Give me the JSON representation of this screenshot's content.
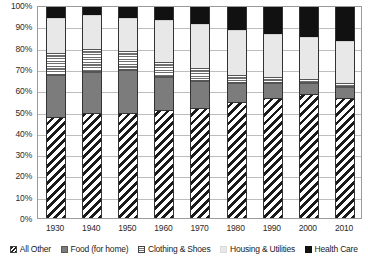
{
  "chart_data": {
    "type": "bar",
    "title": "",
    "subtitle": "",
    "xlabel": "",
    "ylabel": "",
    "stacked": true,
    "stack_mode": "percent",
    "grid": true,
    "legend_position": "bottom",
    "ylim": [
      0,
      100
    ],
    "ytick_labels": [
      "0%",
      "10%",
      "20%",
      "30%",
      "40%",
      "50%",
      "60%",
      "70%",
      "80%",
      "90%",
      "100%"
    ],
    "ytick_values": [
      0,
      10,
      20,
      30,
      40,
      50,
      60,
      70,
      80,
      90,
      100
    ],
    "categories": [
      "1930",
      "1940",
      "1950",
      "1960",
      "1970",
      "1980",
      "1990",
      "2000",
      "2010"
    ],
    "series": [
      {
        "name": "All Other",
        "pattern": "diagonal-hatch",
        "values": [
          48,
          50,
          50,
          51,
          52,
          55,
          57,
          59,
          57
        ]
      },
      {
        "name": "Food (for home)",
        "pattern": "solid-dark-gray",
        "values": [
          20,
          19,
          20,
          16,
          13,
          9,
          7,
          5,
          5
        ]
      },
      {
        "name": "Clothing & Shoes",
        "pattern": "horizontal-stripes",
        "values": [
          10,
          11,
          9,
          7,
          6,
          4,
          3,
          2,
          2
        ]
      },
      {
        "name": "Housing & Utilities",
        "pattern": "solid-light-gray",
        "values": [
          17,
          16,
          16,
          20,
          21,
          21,
          20,
          20,
          20
        ]
      },
      {
        "name": "Health Care",
        "pattern": "solid-black",
        "values": [
          5,
          4,
          5,
          6,
          8,
          11,
          13,
          14,
          16
        ]
      }
    ]
  },
  "colors": {
    "all_other": "#1a1a1a",
    "food": "#7c7c7c",
    "clothing": "#6f6f6f",
    "housing": "#e8e8e8",
    "health_care": "#111111",
    "gridline": "#bdbdbd",
    "border": "#9a9a9a",
    "text": "#2b2b2b"
  }
}
